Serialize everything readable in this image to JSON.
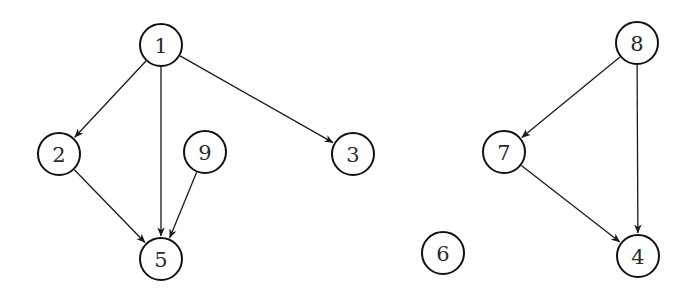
{
  "diagram": {
    "type": "directed-graph",
    "node_radius": 21,
    "colors": {
      "stroke": "#111111",
      "edge": "#1a1a1a",
      "label": "#2a2a2a",
      "background": "#ffffff"
    },
    "nodes": [
      {
        "id": "1",
        "label": "1",
        "x": 161,
        "y": 45
      },
      {
        "id": "2",
        "label": "2",
        "x": 59,
        "y": 154
      },
      {
        "id": "3",
        "label": "3",
        "x": 353,
        "y": 154
      },
      {
        "id": "4",
        "label": "4",
        "x": 638,
        "y": 256
      },
      {
        "id": "5",
        "label": "5",
        "x": 161,
        "y": 259
      },
      {
        "id": "6",
        "label": "6",
        "x": 443,
        "y": 253
      },
      {
        "id": "7",
        "label": "7",
        "x": 504,
        "y": 152
      },
      {
        "id": "8",
        "label": "8",
        "x": 637,
        "y": 43
      },
      {
        "id": "9",
        "label": "9",
        "x": 205,
        "y": 152
      }
    ],
    "edges": [
      {
        "from": "1",
        "to": "2"
      },
      {
        "from": "1",
        "to": "5"
      },
      {
        "from": "1",
        "to": "3"
      },
      {
        "from": "2",
        "to": "5"
      },
      {
        "from": "9",
        "to": "5"
      },
      {
        "from": "8",
        "to": "7"
      },
      {
        "from": "8",
        "to": "4"
      },
      {
        "from": "7",
        "to": "4"
      }
    ]
  }
}
